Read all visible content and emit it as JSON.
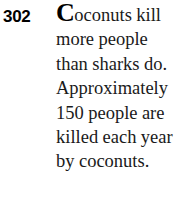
{
  "page": {
    "background_color": "#ffffff",
    "text_color": "#1a1a1a",
    "number_color": "#000000"
  },
  "fact": {
    "number": "302",
    "initial_cap": "C",
    "body_after_cap": "oconuts kill more people than sharks do. Approximately 150 people are killed each year by coconuts.",
    "full_text": "Coconuts kill more people than sharks do. Approximately 150 people are killed each year by coconuts.",
    "lines": [
      "Coconuts",
      "kill more",
      "people than",
      "sharks do.",
      "Approximately",
      "150 people",
      "are killed",
      "each year by",
      "coconuts."
    ]
  }
}
